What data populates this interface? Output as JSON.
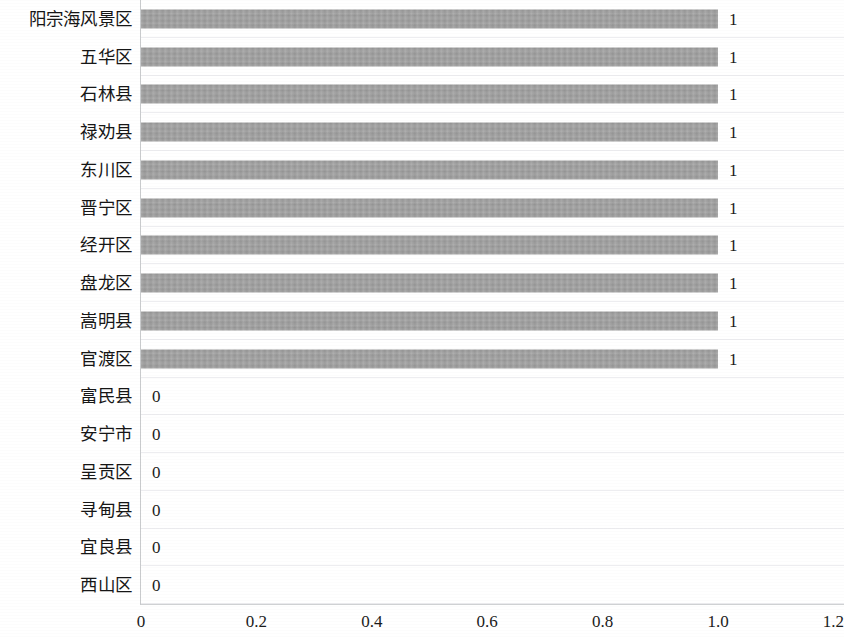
{
  "chart_data": {
    "type": "bar",
    "orientation": "horizontal",
    "title": "",
    "subtitle": "",
    "xlabel": "",
    "ylabel": "",
    "xlim": [
      0,
      1.2
    ],
    "x_ticks": [
      "0",
      "0.2",
      "0.4",
      "0.6",
      "0.8",
      "1.0",
      "1.2"
    ],
    "x_tick_values": [
      0,
      0.2,
      0.4,
      0.6,
      0.8,
      1.0,
      1.2
    ],
    "grid": "horizontal",
    "legend": "none",
    "bar_color": "#9b9b9b",
    "categories": [
      "阳宗海风景区",
      "五华区",
      "石林县",
      "禄劝县",
      "东川区",
      "晋宁区",
      "经开区",
      "盘龙区",
      "嵩明县",
      "官渡区",
      "富民县",
      "安宁市",
      "呈贡区",
      "寻甸县",
      "宜良县",
      "西山区"
    ],
    "values": [
      1,
      1,
      1,
      1,
      1,
      1,
      1,
      1,
      1,
      1,
      0,
      0,
      0,
      0,
      0,
      0
    ],
    "value_labels": [
      "1",
      "1",
      "1",
      "1",
      "1",
      "1",
      "1",
      "1",
      "1",
      "1",
      "0",
      "0",
      "0",
      "0",
      "0",
      "0"
    ]
  }
}
